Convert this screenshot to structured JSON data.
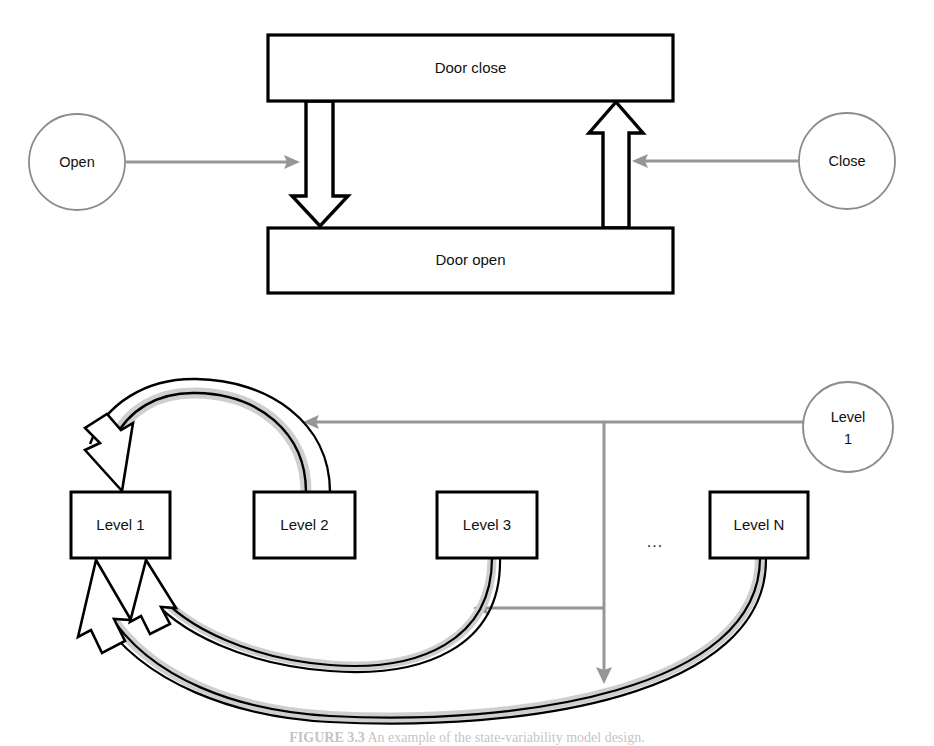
{
  "figure": {
    "caption_bold": "FIGURE 3.3",
    "caption_text": "An example of the state-variability model design."
  },
  "top_diagram": {
    "name": "door-state-diagram",
    "states": [
      {
        "id": "door-close",
        "label": "Door close",
        "x": 268,
        "y": 35,
        "w": 405,
        "h": 66
      },
      {
        "id": "door-open",
        "label": "Door open",
        "x": 268,
        "y": 228,
        "w": 405,
        "h": 65
      }
    ],
    "events": [
      {
        "id": "open",
        "label": "Open",
        "cx": 77,
        "cy": 162,
        "r": 48
      },
      {
        "id": "close",
        "label": "Close",
        "cx": 847,
        "cy": 161,
        "r": 48
      }
    ],
    "transitions": [
      {
        "id": "close-to-open",
        "direction": "down",
        "from": "Door close",
        "to": "Door open"
      },
      {
        "id": "open-to-close",
        "direction": "up",
        "from": "Door open",
        "to": "Door close"
      }
    ],
    "event_links": [
      {
        "id": "open-event-link",
        "from": "Open",
        "to": "close-to-open",
        "direction": "right"
      },
      {
        "id": "close-event-link",
        "from": "Close",
        "to": "open-to-close",
        "direction": "left"
      }
    ]
  },
  "bottom_diagram": {
    "name": "level-state-diagram",
    "states": [
      {
        "id": "level-1",
        "label": "Level 1",
        "italic_tail": "",
        "x": 71,
        "y": 492,
        "w": 99,
        "h": 66
      },
      {
        "id": "level-2",
        "label": "Level 2",
        "italic_tail": "",
        "x": 254,
        "y": 492,
        "w": 101,
        "h": 66
      },
      {
        "id": "level-3",
        "label": "Level 3",
        "italic_tail": "",
        "x": 437,
        "y": 492,
        "w": 100,
        "h": 66
      },
      {
        "id": "level-n",
        "label": "Level ",
        "italic_tail": "N",
        "x": 710,
        "y": 492,
        "w": 98,
        "h": 66
      }
    ],
    "ellipsis": {
      "id": "levels-ellipsis",
      "label": "...",
      "cx": 655,
      "cy": 543
    },
    "events": [
      {
        "id": "level-1-event",
        "label_line1": "Level",
        "label_line2": "1",
        "cx": 848,
        "cy": 427,
        "r": 45
      }
    ],
    "transitions": [
      {
        "id": "level2-to-level1",
        "from": "Level 2",
        "to": "Level 1"
      },
      {
        "id": "level3-to-level1",
        "from": "Level 3",
        "to": "Level 1"
      },
      {
        "id": "leveln-to-level1",
        "from": "Level N",
        "to": "Level 1"
      }
    ],
    "event_links": [
      {
        "id": "event-branch-top",
        "target": "level2-to-level1"
      },
      {
        "id": "event-branch-middle",
        "target": "level3-to-level1"
      },
      {
        "id": "event-branch-bottom",
        "target": "leveln-to-level1"
      }
    ]
  },
  "colors": {
    "stroke": "#000000",
    "gray_arrow": "#969696",
    "node_outline": "#8c8c8c",
    "box_fill": "#ffffff",
    "arrow_shade": "#e0e0e0"
  }
}
